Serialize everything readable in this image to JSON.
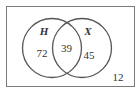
{
  "diagram": {
    "type": "venn",
    "universe": {
      "outside_count": "12"
    },
    "sets": [
      {
        "name": "H",
        "only_count": "72"
      },
      {
        "name": "X",
        "only_count": "45"
      }
    ],
    "intersection": {
      "count": "39"
    },
    "colors": {
      "stroke": "#555555",
      "text": "#333333",
      "border": "#777777"
    }
  }
}
